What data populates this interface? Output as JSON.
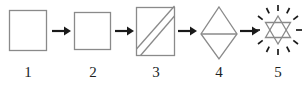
{
  "diagram": {
    "type": "step-sequence",
    "background_color": "#ffffff",
    "shape_stroke_color": "#8a8a8a",
    "arrow_color": "#1a1a1a",
    "label_color": "#201f1f",
    "steps": [
      {
        "label": "1",
        "shape_name": "square",
        "description": "plain square outline"
      },
      {
        "label": "2",
        "shape_name": "square",
        "description": "plain square outline"
      },
      {
        "label": "3",
        "shape_name": "square-with-two-diagonals",
        "description": "square crossed by two parallel diagonal lines running from lower-left to upper-right"
      },
      {
        "label": "4",
        "shape_name": "rhombus-with-horizontal-midline",
        "description": "tall vertical rhombus divided into two triangles by a horizontal center line"
      },
      {
        "label": "5",
        "shape_name": "hexagram-with-rays",
        "description": "six-pointed star of two overlapping triangles surrounded by twelve short radiating dashes"
      }
    ],
    "connectors": [
      {
        "name": "arrow-1-to-2",
        "glyph": "right-arrow"
      },
      {
        "name": "arrow-2-to-3",
        "glyph": "right-arrow"
      },
      {
        "name": "arrow-3-to-4",
        "glyph": "right-arrow"
      },
      {
        "name": "arrow-4-to-5",
        "glyph": "right-arrow"
      }
    ]
  }
}
